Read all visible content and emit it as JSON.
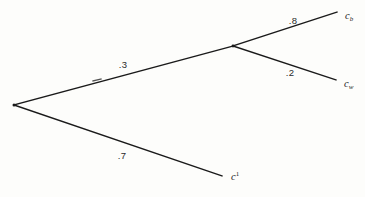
{
  "figure": {
    "type": "probability-tree",
    "background_color": "#fdfdfb",
    "line_color": "#1a1a1a",
    "root": {
      "name": "root-node",
      "x": 14,
      "y": 105
    },
    "internal_nodes": [
      {
        "name": "branch-node",
        "x": 233,
        "y": 46
      }
    ],
    "edges": [
      {
        "id": "edge-root-to-branch",
        "from_x": 14,
        "from_y": 105,
        "to_x": 233,
        "to_y": 46,
        "probability": ".3",
        "label_x": 123,
        "label_y": 68
      },
      {
        "id": "edge-root-to-c1",
        "from_x": 14,
        "from_y": 105,
        "to_x": 222,
        "to_y": 176,
        "probability": ".7",
        "label_x": 122,
        "label_y": 159
      },
      {
        "id": "edge-branch-to-cb",
        "from_x": 233,
        "from_y": 46,
        "to_x": 337,
        "to_y": 12,
        "probability": ".8",
        "label_x": 293,
        "label_y": 24
      },
      {
        "id": "edge-branch-to-cw",
        "from_x": 233,
        "from_y": 46,
        "to_x": 336,
        "to_y": 80,
        "probability": ".2",
        "label_x": 290,
        "label_y": 76
      }
    ],
    "terminals": [
      {
        "id": "terminal-cb",
        "base": "c",
        "subscript": "b",
        "superscript": "",
        "x": 345,
        "y": 19
      },
      {
        "id": "terminal-cw",
        "base": "c",
        "subscript": "w",
        "superscript": "",
        "x": 344,
        "y": 87
      },
      {
        "id": "terminal-c1",
        "base": "c",
        "subscript": "",
        "superscript": "1",
        "x": 231,
        "y": 180
      }
    ],
    "tick_marks": [
      {
        "id": "branch-tick",
        "x": 97,
        "y": 79
      }
    ]
  }
}
